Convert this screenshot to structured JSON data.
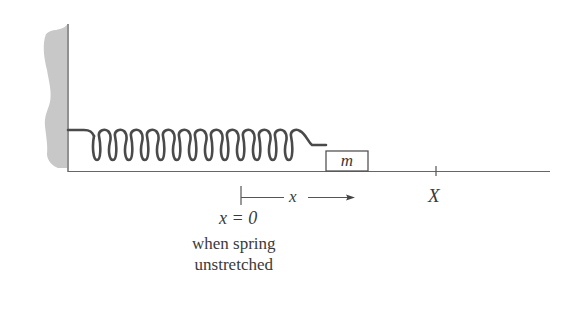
{
  "diagram": {
    "type": "spring-mass system",
    "colors": {
      "line": "#555555",
      "wall_fill": "#c8c8c8",
      "spring": "#4a4a4a",
      "text": "#3a3a3a"
    },
    "wall": {
      "label": "fixed wall"
    },
    "spring": {
      "coils": 12
    },
    "mass": {
      "label": "m"
    },
    "displacement": {
      "label": "x"
    },
    "position_marker": {
      "label": "X"
    },
    "origin": {
      "label": "x = 0",
      "caption_line1": "when spring",
      "caption_line2": "unstretched"
    }
  }
}
